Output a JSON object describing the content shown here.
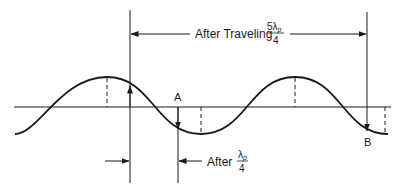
{
  "diagram": {
    "type": "traveling-wave-phase-diagram",
    "top_annotation": {
      "prefix": "After Traveling",
      "fraction_numerator": "5λ",
      "fraction_subscript": "p",
      "fraction_denominator": "4"
    },
    "bottom_annotation": {
      "prefix": "After",
      "fraction_numerator": "λ",
      "fraction_subscript": "p",
      "fraction_denominator": "4"
    },
    "points": [
      {
        "label": "A"
      },
      {
        "label": "B"
      }
    ],
    "colors": {
      "stroke": "#1a1a1a",
      "background": "#ffffff"
    }
  }
}
